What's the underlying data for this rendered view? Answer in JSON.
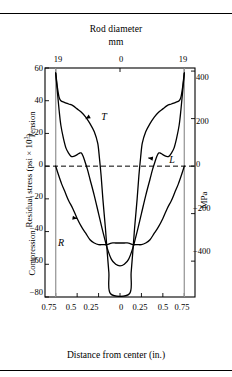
{
  "figure": {
    "top_title_line1": "Rod diameter",
    "top_title_line2": "mm",
    "bottom_title": "Distance from center (in.)",
    "ylabel_outer": "Residual stress (psi × 10³)",
    "ylabel_tension": "Tension",
    "ylabel_compression": "Compression",
    "ylabel_right": "MPa"
  },
  "chart_data": {
    "type": "line",
    "title": "Rod diameter",
    "subtitle": "mm",
    "xlabel": "Distance from center (in.)",
    "ylabel": "Residual stress (psi × 10³)",
    "ylabel_right": "MPa",
    "top_axis_label": "Rod diameter (mm)",
    "grid": false,
    "legend": "inline-annotations",
    "xlim": [
      -0.875,
      0.875
    ],
    "ylim": [
      -80,
      60
    ],
    "ylim_right": [
      -551,
      413
    ],
    "xticks": [
      -0.75,
      -0.5,
      -0.25,
      0,
      0.25,
      0.5,
      0.75
    ],
    "xticklabels": [
      "0.75",
      "0.5",
      "0.25",
      "0",
      "0.25",
      "0.5",
      "0.75"
    ],
    "yticks": [
      -80,
      -60,
      -40,
      -20,
      0,
      20,
      40,
      60
    ],
    "yticklabels": [
      "−80",
      "−60",
      "−40",
      "−20",
      "0",
      "20",
      "40",
      "60"
    ],
    "yticks_right": [
      -400,
      -200,
      0,
      200,
      400
    ],
    "yticklabels_right": [
      "−400",
      "−200",
      "0",
      "200",
      "400"
    ],
    "top_xticks": [
      -0.75,
      0,
      0.75
    ],
    "top_xticklabels": [
      "19",
      "0",
      "19"
    ],
    "zero_line": {
      "value": 0,
      "style": "dashed"
    },
    "vertical_reference_lines": [
      -0.75,
      0.75
    ],
    "annotations": [
      {
        "text": "T",
        "x": -0.3,
        "y": 32,
        "arrow_to": [
          -0.4,
          29
        ]
      },
      {
        "text": "L",
        "x": 0.45,
        "y": 4,
        "arrow_to": [
          0.33,
          5
        ]
      },
      {
        "text": "R",
        "x": -0.62,
        "y": -31,
        "arrow_to": [
          -0.5,
          -32
        ]
      }
    ],
    "series": [
      {
        "name": "T",
        "label": "T",
        "description": "Tangential residual stress",
        "points": [
          [
            -0.75,
            57
          ],
          [
            -0.73,
            48
          ],
          [
            -0.71,
            42
          ],
          [
            -0.69,
            40
          ],
          [
            -0.65,
            39
          ],
          [
            -0.6,
            38
          ],
          [
            -0.55,
            37
          ],
          [
            -0.5,
            35
          ],
          [
            -0.45,
            33
          ],
          [
            -0.4,
            30
          ],
          [
            -0.35,
            26
          ],
          [
            -0.3,
            21
          ],
          [
            -0.26,
            14
          ],
          [
            -0.24,
            5
          ],
          [
            -0.22,
            -6
          ],
          [
            -0.2,
            -20
          ],
          [
            -0.17,
            -38
          ],
          [
            -0.15,
            -52
          ],
          [
            -0.13,
            -65
          ],
          [
            -0.11,
            -78
          ],
          [
            0.11,
            -78
          ],
          [
            0.13,
            -65
          ],
          [
            0.15,
            -52
          ],
          [
            0.17,
            -38
          ],
          [
            0.2,
            -20
          ],
          [
            0.22,
            -6
          ],
          [
            0.24,
            5
          ],
          [
            0.26,
            14
          ],
          [
            0.3,
            21
          ],
          [
            0.35,
            26
          ],
          [
            0.4,
            30
          ],
          [
            0.45,
            33
          ],
          [
            0.5,
            35
          ],
          [
            0.55,
            37
          ],
          [
            0.6,
            38
          ],
          [
            0.65,
            39
          ],
          [
            0.69,
            40
          ],
          [
            0.71,
            42
          ],
          [
            0.73,
            48
          ],
          [
            0.75,
            57
          ]
        ]
      },
      {
        "name": "L",
        "label": "L",
        "description": "Longitudinal residual stress",
        "points": [
          [
            -0.75,
            57
          ],
          [
            -0.73,
            45
          ],
          [
            -0.71,
            34
          ],
          [
            -0.69,
            25
          ],
          [
            -0.66,
            17
          ],
          [
            -0.63,
            11
          ],
          [
            -0.6,
            8
          ],
          [
            -0.57,
            6
          ],
          [
            -0.54,
            6
          ],
          [
            -0.5,
            7
          ],
          [
            -0.47,
            8
          ],
          [
            -0.45,
            8
          ],
          [
            -0.43,
            6
          ],
          [
            -0.41,
            3
          ],
          [
            -0.38,
            -2
          ],
          [
            -0.35,
            -8
          ],
          [
            -0.3,
            -18
          ],
          [
            -0.25,
            -29
          ],
          [
            -0.2,
            -40
          ],
          [
            -0.15,
            -50
          ],
          [
            -0.1,
            -57
          ],
          [
            -0.05,
            -60
          ],
          [
            0.0,
            -61
          ],
          [
            0.05,
            -60
          ],
          [
            0.1,
            -57
          ],
          [
            0.15,
            -50
          ],
          [
            0.2,
            -40
          ],
          [
            0.25,
            -29
          ],
          [
            0.3,
            -18
          ],
          [
            0.35,
            -8
          ],
          [
            0.38,
            -2
          ],
          [
            0.41,
            3
          ],
          [
            0.43,
            6
          ],
          [
            0.45,
            8
          ],
          [
            0.47,
            8
          ],
          [
            0.5,
            7
          ],
          [
            0.54,
            6
          ],
          [
            0.57,
            6
          ],
          [
            0.6,
            8
          ],
          [
            0.63,
            11
          ],
          [
            0.66,
            17
          ],
          [
            0.69,
            25
          ],
          [
            0.71,
            34
          ],
          [
            0.73,
            45
          ],
          [
            0.75,
            57
          ]
        ]
      },
      {
        "name": "R",
        "label": "R",
        "description": "Radial residual stress",
        "points": [
          [
            -0.75,
            0
          ],
          [
            -0.72,
            -5
          ],
          [
            -0.68,
            -11
          ],
          [
            -0.64,
            -16
          ],
          [
            -0.6,
            -21
          ],
          [
            -0.55,
            -26
          ],
          [
            -0.5,
            -32
          ],
          [
            -0.45,
            -37
          ],
          [
            -0.4,
            -41
          ],
          [
            -0.35,
            -45
          ],
          [
            -0.3,
            -47
          ],
          [
            -0.25,
            -48
          ],
          [
            -0.2,
            -48
          ],
          [
            -0.15,
            -48
          ],
          [
            -0.1,
            -47
          ],
          [
            -0.05,
            -47
          ],
          [
            0.0,
            -47
          ],
          [
            0.05,
            -47
          ],
          [
            0.1,
            -47
          ],
          [
            0.15,
            -48
          ],
          [
            0.2,
            -48
          ],
          [
            0.25,
            -48
          ],
          [
            0.3,
            -47
          ],
          [
            0.35,
            -45
          ],
          [
            0.4,
            -41
          ],
          [
            0.45,
            -37
          ],
          [
            0.5,
            -32
          ],
          [
            0.55,
            -26
          ],
          [
            0.6,
            -21
          ],
          [
            0.64,
            -16
          ],
          [
            0.68,
            -11
          ],
          [
            0.72,
            -5
          ],
          [
            0.75,
            0
          ]
        ]
      }
    ]
  }
}
